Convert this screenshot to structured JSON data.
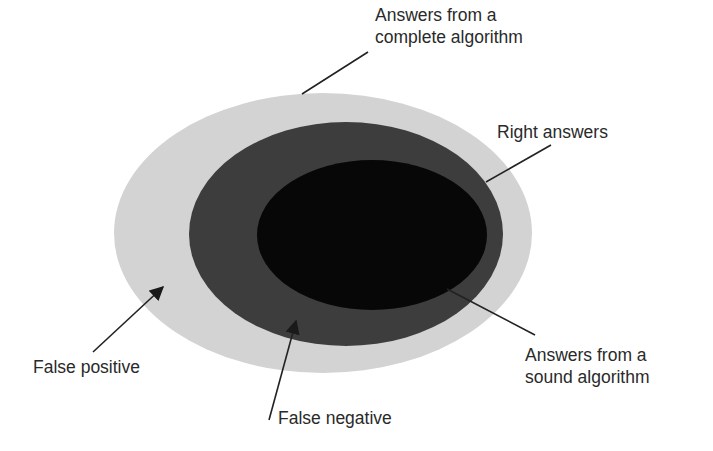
{
  "diagram": {
    "type": "nested-sets",
    "regions": [
      {
        "id": "complete",
        "name": "Answers from a complete algorithm",
        "color": "#d3d3d3",
        "cx": 323,
        "cy": 233,
        "rx": 209,
        "ry": 140
      },
      {
        "id": "right",
        "name": "Right answers",
        "color": "#3d3d3d",
        "cx": 346,
        "cy": 234,
        "rx": 157,
        "ry": 112
      },
      {
        "id": "sound",
        "name": "Answers from a sound algorithm",
        "color": "#070707",
        "cx": 372,
        "cy": 235,
        "rx": 115,
        "ry": 75
      }
    ]
  },
  "labels": {
    "complete": {
      "line1": "Answers from a",
      "line2": "complete algorithm"
    },
    "right": {
      "line1": "Right answers"
    },
    "sound": {
      "line1": "Answers from a",
      "line2": "sound algorithm"
    },
    "false_positive": {
      "line1": "False positive"
    },
    "false_negative": {
      "line1": "False negative"
    }
  },
  "colors": {
    "text": "#2a2a2a",
    "line": "#222222",
    "background": "#ffffff"
  }
}
